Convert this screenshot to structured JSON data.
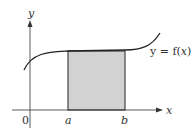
{
  "diagram": {
    "axis_labels": {
      "x": "x",
      "y": "y",
      "origin": "0"
    },
    "interval_labels": {
      "a": "a",
      "b": "b"
    },
    "curve_label_prefix": "y = f(",
    "curve_label_var": "x",
    "curve_label_suffix": ")",
    "colors": {
      "shade": "#cfcfcf",
      "stroke": "#222222"
    }
  }
}
